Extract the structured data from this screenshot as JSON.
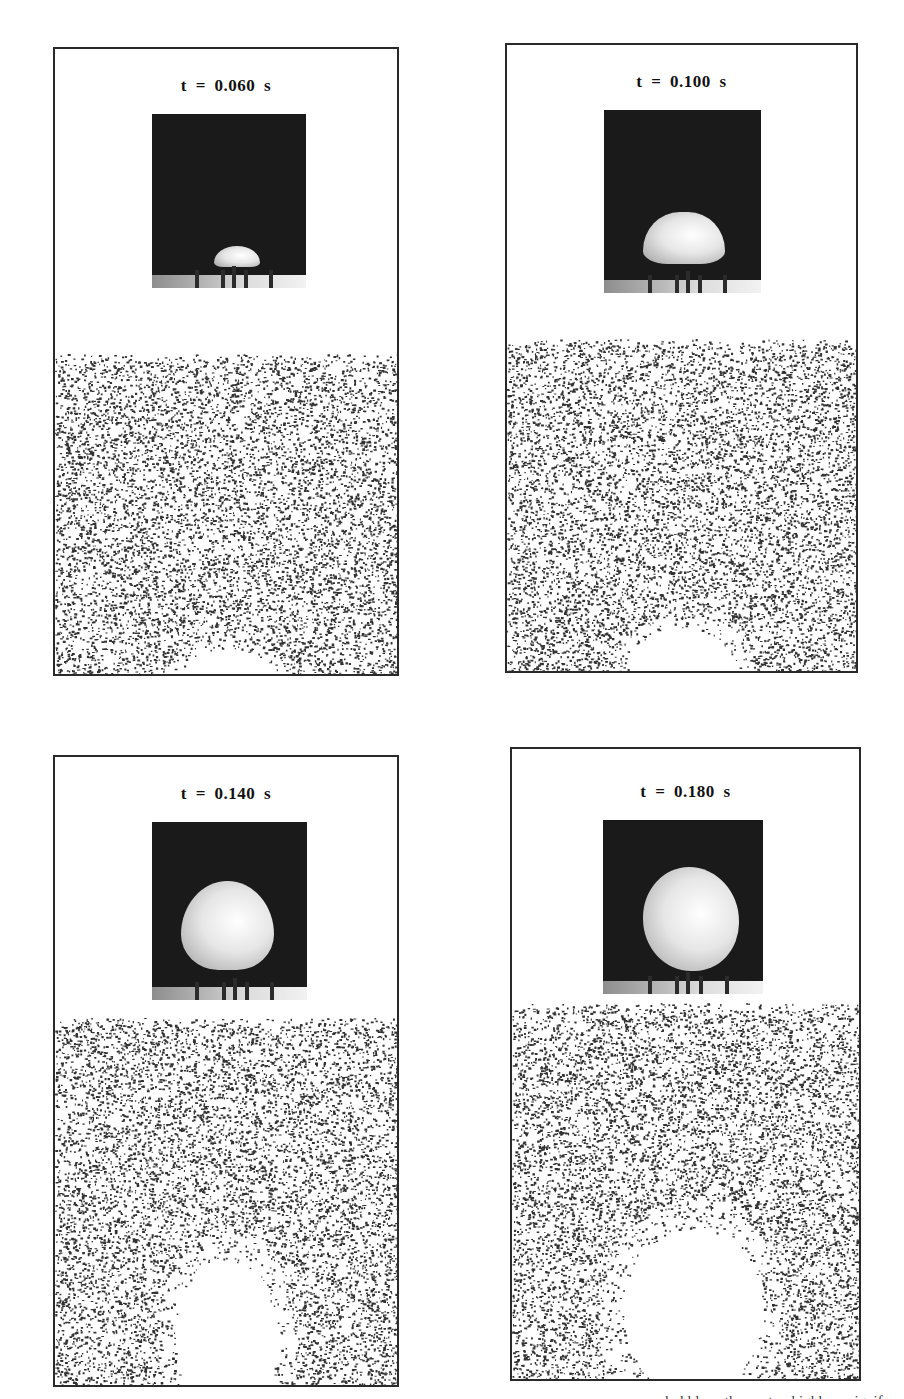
{
  "figure": {
    "panels": [
      {
        "id": "p1",
        "title": "t = 0.060 s",
        "time_s": 0.06,
        "box": {
          "left": 53,
          "top": 47,
          "width": 346,
          "height": 629
        },
        "photo": {
          "left": 97,
          "top": 65,
          "width": 154,
          "height": 174
        },
        "bubble": {
          "cx": 0.55,
          "cy": 0.82,
          "rx": 0.15,
          "ry": 0.06,
          "shape": "cap"
        },
        "particles_top": 305,
        "void": {
          "cx": 0.5,
          "cy": 1.0,
          "rx": 0.13,
          "ry": 0.08
        }
      },
      {
        "id": "p2",
        "title": "t = 0.100 s",
        "time_s": 0.1,
        "box": {
          "left": 505,
          "top": 43,
          "width": 353,
          "height": 630
        },
        "photo": {
          "left": 97,
          "top": 65,
          "width": 157,
          "height": 183
        },
        "bubble": {
          "cx": 0.51,
          "cy": 0.7,
          "rx": 0.26,
          "ry": 0.14,
          "shape": "mushroom"
        },
        "particles_top": 294,
        "void": {
          "cx": 0.5,
          "cy": 1.0,
          "rx": 0.15,
          "ry": 0.13
        }
      },
      {
        "id": "p3",
        "title": "t = 0.140 s",
        "time_s": 0.14,
        "box": {
          "left": 53,
          "top": 755,
          "width": 346,
          "height": 632
        },
        "photo": {
          "left": 97,
          "top": 65,
          "width": 155,
          "height": 178
        },
        "bubble": {
          "cx": 0.49,
          "cy": 0.58,
          "rx": 0.3,
          "ry": 0.25,
          "shape": "dome"
        },
        "particles_top": 261,
        "void": {
          "cx": 0.5,
          "cy": 0.88,
          "rx": 0.15,
          "ry": 0.22
        }
      },
      {
        "id": "p4",
        "title": "t = 0.180 s",
        "time_s": 0.18,
        "box": {
          "left": 510,
          "top": 747,
          "width": 351,
          "height": 634
        },
        "photo": {
          "left": 91,
          "top": 71,
          "width": 160,
          "height": 174
        },
        "bubble": {
          "cx": 0.55,
          "cy": 0.57,
          "rx": 0.3,
          "ry": 0.3,
          "shape": "sphere"
        },
        "particles_top": 254,
        "void": {
          "cx": 0.52,
          "cy": 0.82,
          "rx": 0.2,
          "ry": 0.22
        }
      }
    ],
    "caption_fragment": "... bubble ... the ... at ... highly ... signif..."
  },
  "colors": {
    "frame": "#2a2a2a",
    "photo_background": "#1a1a1a",
    "particle": "#333333",
    "text": "#111111"
  }
}
